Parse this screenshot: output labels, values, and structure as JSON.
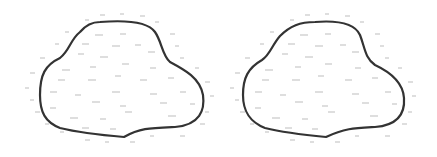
{
  "figure": {
    "shapes": [
      {
        "name": "left-pond",
        "stroke": "#333333"
      },
      {
        "name": "right-pond",
        "stroke": "#333333"
      }
    ],
    "colors": {
      "outline": "#333333",
      "texture": "#b8b8b8",
      "background": "#ffffff"
    }
  }
}
